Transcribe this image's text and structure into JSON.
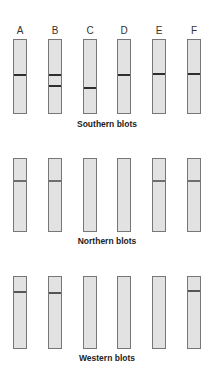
{
  "lane_labels": [
    "A",
    "B",
    "C",
    "D",
    "E",
    "F"
  ],
  "lane_x": [
    13,
    48,
    83,
    117,
    152,
    187
  ],
  "panels": [
    {
      "title": "Southern blots",
      "top": 39,
      "bottom": 112,
      "title_y": 119,
      "band_color": "#2e2e2e",
      "bands": [
        [
          74
        ],
        [
          74,
          85
        ],
        [
          87
        ],
        [
          74
        ],
        [
          73
        ],
        [
          73
        ]
      ]
    },
    {
      "title": "Northern blots",
      "top": 158,
      "bottom": 230,
      "title_y": 236,
      "band_color": "#6e6e6e",
      "bands": [
        [
          180
        ],
        [
          180
        ],
        [],
        [],
        [
          180
        ],
        [
          180
        ]
      ]
    },
    {
      "title": "Western blots",
      "top": 276,
      "bottom": 347,
      "title_y": 353,
      "band_color": "#555555",
      "bands": [
        [
          291
        ],
        [
          292
        ],
        [],
        [],
        [],
        [
          290
        ]
      ]
    }
  ],
  "colors": {
    "lane_fill": "#e2e2e2",
    "lane_border": "#777777"
  }
}
